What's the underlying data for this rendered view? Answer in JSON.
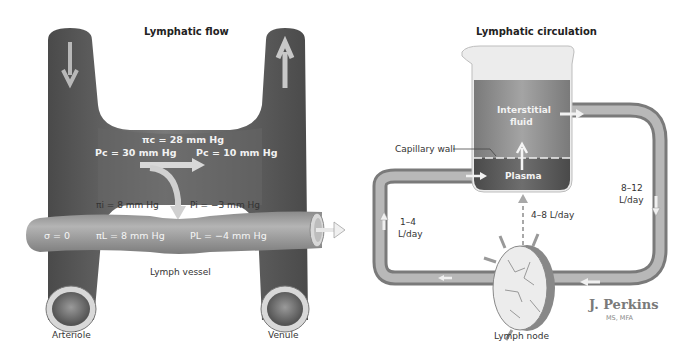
{
  "left_panel": {
    "title": "Lymphatic flow",
    "labels": {
      "pi_c": "πc = 28 mm Hg",
      "p_c_arterial": "Pc = 30 mm Hg",
      "p_c_venous": "Pc = 10 mm Hg",
      "pi_i": "πi = 8 mm Hg",
      "p_i": "Pi = −3 mm Hg",
      "sigma": "σ = 0",
      "pi_l": "πL = 8 mm Hg",
      "p_l": "PL = −4 mm Hg",
      "lymph_vessel": "Lymph vessel",
      "arteriole": "Arteriole",
      "venule": "Venule"
    }
  },
  "right_panel": {
    "title": "Lymphatic circulation",
    "labels": {
      "interstitial_fluid_line1": "Interstitial",
      "interstitial_fluid_line2": "fluid",
      "capillary_wall": "Capillary wall",
      "plasma": "Plasma",
      "flow_out_line1": "8–12",
      "flow_out_line2": "L/day",
      "flow_return_line1": "1–4",
      "flow_return_line2": "L/day",
      "flow_node": "4–8 L/day",
      "lymph_node": "Lymph node"
    }
  },
  "signature": {
    "name": "J. Perkins",
    "credentials": "MS, MFA"
  },
  "colors": {
    "vessel": "#6b6b6b",
    "vessel_dark": "#4e4e4e",
    "lymph_vessel": "#9a9a9a",
    "beaker_fluid": "#8c8c8c",
    "plasma": "#5c5c5c",
    "arrow": "#e6e6e6"
  }
}
